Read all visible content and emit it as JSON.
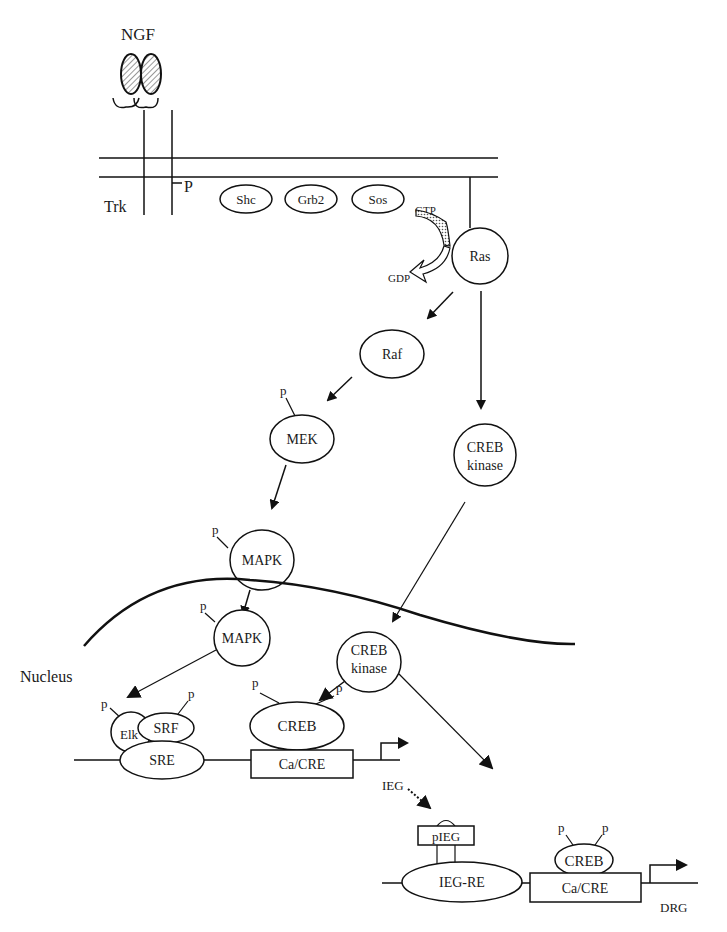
{
  "diagram": {
    "ligand": "NGF",
    "receptor": "Trk",
    "receptor_phospho": "P",
    "adaptors": [
      "Shc",
      "Grb2",
      "Sos"
    ],
    "gtp_label": "GTP",
    "gdp_label": "GDP",
    "ras": "Ras",
    "raf": "Raf",
    "mek": "MEK",
    "mapk_cytoplasm": "MAPK",
    "mapk_nucleus": "MAPK",
    "creb_kinase_cyto_line1": "CREB",
    "creb_kinase_cyto_line2": "kinase",
    "creb_kinase_nuc_line1": "CREB",
    "creb_kinase_nuc_line2": "kinase",
    "nucleus_label": "Nucleus",
    "phospho_p": "p",
    "promoter1": {
      "elk": "Elk",
      "srf": "SRF",
      "sre": "SRE",
      "creb": "CREB",
      "ca_cre": "Ca/CRE"
    },
    "ieg_label": "IEG",
    "promoter2": {
      "pieg": "pIEG",
      "ieg_re": "IEG-RE",
      "creb": "CREB",
      "ca_cre": "Ca/CRE"
    },
    "cell_label": "DRG"
  }
}
